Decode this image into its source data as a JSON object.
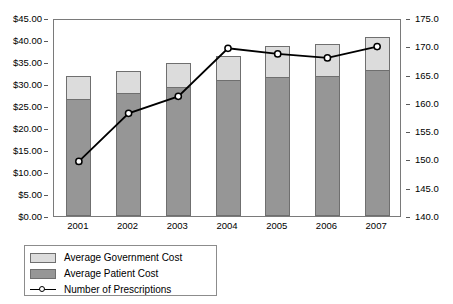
{
  "chart_data": {
    "type": "bar",
    "title": "",
    "xlabel": "",
    "ylabel": "",
    "grid": false,
    "legend_position": "bottom-left",
    "categories": [
      "2001",
      "2002",
      "2003",
      "2004",
      "2005",
      "2006",
      "2007"
    ],
    "axes": {
      "left": {
        "label": "",
        "min": 0.0,
        "max": 45.0,
        "step": 5.0,
        "ticks": [
          "$0.00",
          "$5.00",
          "$10.00",
          "$15.00",
          "$20.00",
          "$25.00",
          "$30.00",
          "$35.00",
          "$40.00",
          "$45.00"
        ],
        "tick_values": [
          0,
          5,
          10,
          15,
          20,
          25,
          30,
          35,
          40,
          45
        ]
      },
      "right": {
        "label": "",
        "min": 140.0,
        "max": 175.0,
        "step": 5.0,
        "ticks": [
          "140.0",
          "145.0",
          "150.0",
          "155.0",
          "160.0",
          "165.0",
          "170.0",
          "175.0"
        ],
        "tick_values": [
          140,
          145,
          150,
          155,
          160,
          165,
          170,
          175
        ]
      }
    },
    "series": [
      {
        "name": "Average Patient Cost",
        "type": "bar",
        "stack": "cost",
        "axis": "left",
        "color": "#969696",
        "values": [
          26.5,
          28.0,
          29.3,
          30.8,
          31.5,
          31.8,
          33.2
        ]
      },
      {
        "name": "Average Government Cost",
        "type": "bar",
        "stack": "cost",
        "axis": "left",
        "color": "#dcdcdc",
        "values": [
          5.3,
          5.0,
          5.5,
          5.6,
          7.2,
          7.4,
          7.4
        ]
      },
      {
        "name": "Number of Prescriptions",
        "type": "line",
        "axis": "right",
        "color": "#000000",
        "marker": "circle-open",
        "values": [
          150.0,
          158.5,
          161.5,
          170.0,
          169.0,
          168.3,
          170.3
        ]
      }
    ],
    "bar_totals": [
      31.8,
      33.0,
      34.8,
      36.4,
      38.7,
      39.2,
      40.6
    ]
  },
  "legend": {
    "items": [
      {
        "label": "Average Government Cost",
        "key": "swatch-light-gray"
      },
      {
        "label": "Average Patient Cost",
        "key": "swatch-dark-gray"
      },
      {
        "label": "Number of Prescriptions",
        "key": "line-with-open-circle-marker"
      }
    ]
  },
  "colors": {
    "government_cost": "#dcdcdc",
    "patient_cost": "#969696",
    "line": "#000000",
    "axis": "#7a7a7a",
    "background": "#ffffff"
  }
}
